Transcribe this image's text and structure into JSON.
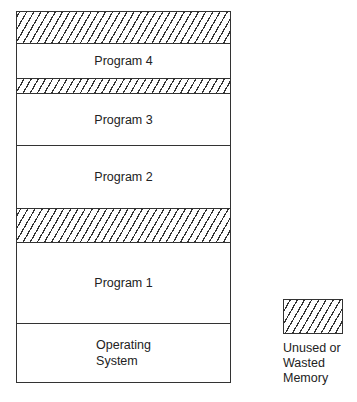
{
  "diagram": {
    "memory_segments": [
      {
        "type": "unused",
        "label": "",
        "top": 0,
        "height": 32
      },
      {
        "type": "program",
        "label": "Program 4",
        "top": 32,
        "height": 34
      },
      {
        "type": "unused",
        "label": "",
        "top": 66,
        "height": 16
      },
      {
        "type": "program",
        "label": "Program 3",
        "top": 82,
        "height": 51
      },
      {
        "type": "program",
        "label": "Program 2",
        "top": 133,
        "height": 63
      },
      {
        "type": "unused",
        "label": "",
        "top": 196,
        "height": 35
      },
      {
        "type": "program",
        "label": "Program 1",
        "top": 231,
        "height": 80
      },
      {
        "type": "os",
        "label": "Operating\nSystem",
        "top": 311,
        "height": 61
      }
    ],
    "legend": {
      "label": "Unused or\nWasted\nMemory",
      "pattern": "diagonal-hatch"
    }
  }
}
